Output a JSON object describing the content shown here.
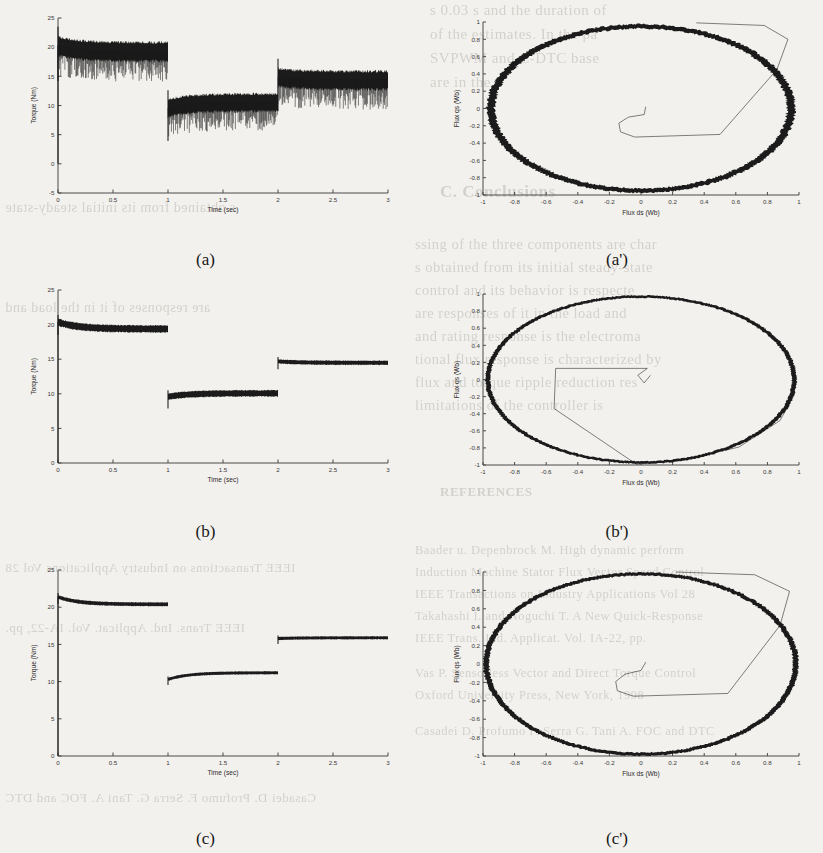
{
  "figure": {
    "panels": [
      {
        "id": "a",
        "caption": "(a)"
      },
      {
        "id": "a2",
        "caption": "(a')"
      },
      {
        "id": "b",
        "caption": "(b)"
      },
      {
        "id": "b2",
        "caption": "(b')"
      },
      {
        "id": "c",
        "caption": "(c)"
      },
      {
        "id": "c2",
        "caption": "(c')"
      }
    ]
  },
  "bleed_text": {
    "lines": [
      "s 0.03 s  and the duration of",
      "of the estimates.  In  the pa",
      "SVPWM and C-DTC base",
      "are in the",
      "C. Conclusions",
      "ssing of the three components are char",
      "s obtained  from  its initial  steady-state",
      "control  and  its behavior is  respecte",
      "are responses of  it  in  the  load  and",
      "and rating  response  is  the  electroma",
      "tional  flux  response  is  characterized  by",
      "flux  and  torque  ripple  reduction  res",
      "limitations of the controller is",
      "REFERENCES",
      "Baader  u.  Depenbrock  M.  High  dynamic perform",
      "Induction  Machine  Stator  Flux  Vector  Speed  Control",
      "IEEE  Transactions  on  Industry  Applications  Vol  28",
      "Takahashi  I.  and  Noguchi  T.  A  New  Quick-Response",
      "IEEE  Trans.  Ind.  Applicat.  Vol.  IA-22,  pp.",
      "Vas  P.  Sensorless  Vector  and  Direct  Torque  Control",
      "Oxford  University  Press,  New  York,  1998",
      "Casadei  D.  Profumo  F.  Serra  G.  Tani  A.  FOC  and  DTC"
    ]
  },
  "chart_data": [
    {
      "id": "a",
      "type": "line",
      "title": "",
      "xlabel": "Time (sec)",
      "ylabel": "Torque (Nm)",
      "xlim": [
        0,
        3
      ],
      "ylim": [
        -5,
        25
      ],
      "xticks": [
        0,
        0.5,
        1,
        1.5,
        2,
        2.5,
        3
      ],
      "xticklabels": [
        "0",
        "0.5",
        "1",
        "1.5",
        "2",
        "2.5",
        "3"
      ],
      "yticks": [
        -5,
        0,
        5,
        10,
        15,
        20,
        25
      ],
      "yticklabels": [
        "-5",
        "0",
        "5",
        "10",
        "15",
        "20",
        "25"
      ],
      "grid": false,
      "legend": "none",
      "description": "Electromagnetic torque with large hysteresis ripple; three load steps",
      "segments": [
        {
          "t_start": 0.0,
          "t_end": 1.0,
          "mean_start": 20.3,
          "mean_end": 19.3,
          "ripple": 3.2
        },
        {
          "t_start": 1.0,
          "t_end": 2.0,
          "mean_start": 9.6,
          "mean_end": 10.6,
          "ripple": 3.0
        },
        {
          "t_start": 2.0,
          "t_end": 3.0,
          "mean_start": 14.9,
          "mean_end": 14.4,
          "ripple": 3.1
        }
      ]
    },
    {
      "id": "a2",
      "type": "line",
      "title": "",
      "xlabel": "Flux ds (Wb)",
      "ylabel": "Flux qs (Wb)",
      "xlim": [
        -1,
        1
      ],
      "ylim": [
        -1,
        1
      ],
      "xticks": [
        -1,
        -0.8,
        -0.6,
        -0.4,
        -0.2,
        0,
        0.2,
        0.4,
        0.6,
        0.8,
        1
      ],
      "xticklabels": [
        "-1",
        "-0.8",
        "-0.6",
        "-0.4",
        "-0.2",
        "0",
        "0.2",
        "0.4",
        "0.6",
        "0.8",
        "1"
      ],
      "yticks": [
        -1,
        -0.8,
        -0.6,
        -0.4,
        -0.2,
        0,
        0.2,
        0.4,
        0.6,
        0.8,
        1
      ],
      "yticklabels": [
        "-1",
        "-0.8",
        "-0.6",
        "-0.4",
        "-0.2",
        "0",
        "0.2",
        "0.4",
        "0.6",
        "0.8",
        "1"
      ],
      "grid": false,
      "legend": "none",
      "description": "Stator flux locus: thick noisy circle radius ~0.95 Wb plus start-up polygon trajectory from origin",
      "circle_radius": 0.95,
      "circle_thickness": 0.05,
      "startup_path": [
        [
          0.03,
          0.02
        ],
        [
          0.02,
          -0.07
        ],
        [
          -0.08,
          -0.1
        ],
        [
          -0.14,
          -0.17
        ],
        [
          -0.13,
          -0.27
        ],
        [
          -0.04,
          -0.33
        ],
        [
          0.5,
          -0.3
        ],
        [
          0.86,
          0.45
        ],
        [
          0.93,
          0.8
        ],
        [
          0.78,
          0.96
        ],
        [
          0.35,
          0.99
        ]
      ]
    },
    {
      "id": "b",
      "type": "line",
      "title": "",
      "xlabel": "Time (sec)",
      "ylabel": "Torque (Nm)",
      "xlim": [
        0,
        3
      ],
      "ylim": [
        0,
        25
      ],
      "xticks": [
        0,
        0.5,
        1,
        1.5,
        2,
        2.5,
        3
      ],
      "xticklabels": [
        "0",
        "0.5",
        "1",
        "1.5",
        "2",
        "2.5",
        "3"
      ],
      "yticks": [
        0,
        5,
        10,
        15,
        20,
        25
      ],
      "yticklabels": [
        "0",
        "5",
        "10",
        "15",
        "20",
        "25"
      ],
      "grid": false,
      "legend": "none",
      "description": "Torque with reduced ripple; three load steps",
      "segments": [
        {
          "t_start": 0.0,
          "t_end": 1.0,
          "mean_start": 20.4,
          "mean_end": 19.4,
          "ripple": 1.0
        },
        {
          "t_start": 1.0,
          "t_end": 2.0,
          "mean_start": 9.6,
          "mean_end": 10.1,
          "ripple": 0.9
        },
        {
          "t_start": 2.0,
          "t_end": 3.0,
          "mean_start": 14.7,
          "mean_end": 14.5,
          "ripple": 0.6
        }
      ]
    },
    {
      "id": "b2",
      "type": "line",
      "title": "",
      "xlabel": "Flux ds (Wb)",
      "ylabel": "Flux qs (Wb)",
      "xlim": [
        -1,
        1
      ],
      "ylim": [
        -1,
        1
      ],
      "xticks": [
        -1,
        -0.8,
        -0.6,
        -0.4,
        -0.2,
        0,
        0.2,
        0.4,
        0.6,
        0.8,
        1
      ],
      "xticklabels": [
        "-1",
        "-0.8",
        "-0.6",
        "-0.4",
        "-0.2",
        "0",
        "0.2",
        "0.4",
        "0.6",
        "0.8",
        "1"
      ],
      "yticks": [
        -1,
        -0.8,
        -0.6,
        -0.4,
        -0.2,
        0,
        0.2,
        0.4,
        0.6,
        0.8,
        1
      ],
      "yticklabels": [
        "-1",
        "-0.8",
        "-0.6",
        "-0.4",
        "-0.2",
        "0",
        "0.2",
        "0.4",
        "0.6",
        "0.8",
        "1"
      ],
      "grid": false,
      "legend": "none",
      "description": "Stator flux locus: smoother circle radius ~0.97 Wb with start-up trajectory descending to -1 then sweeping right",
      "circle_radius": 0.97,
      "circle_thickness": 0.03,
      "startup_path": [
        [
          0.06,
          0.05
        ],
        [
          0.02,
          -0.04
        ],
        [
          -0.02,
          0.05
        ],
        [
          0.04,
          0.13
        ],
        [
          -0.54,
          0.13
        ],
        [
          -0.55,
          -0.34
        ],
        [
          -0.03,
          -0.99
        ],
        [
          0.25,
          -0.95
        ],
        [
          0.62,
          -0.79
        ],
        [
          0.88,
          -0.48
        ],
        [
          0.97,
          -0.18
        ],
        [
          0.96,
          -0.05
        ]
      ]
    },
    {
      "id": "c",
      "type": "line",
      "title": "",
      "xlabel": "Time (sec)",
      "ylabel": "Torque (Nm)",
      "xlim": [
        0,
        3
      ],
      "ylim": [
        0,
        25
      ],
      "xticks": [
        0,
        0.5,
        1,
        1.5,
        2,
        2.5,
        3
      ],
      "xticklabels": [
        "0",
        "0.5",
        "1",
        "1.5",
        "2",
        "2.5",
        "3"
      ],
      "yticks": [
        0,
        5,
        10,
        15,
        20,
        25
      ],
      "yticklabels": [
        "0",
        "5",
        "10",
        "15",
        "20",
        "25"
      ],
      "grid": false,
      "legend": "none",
      "description": "Torque with smallest ripple; three load steps with exponential settling",
      "segments": [
        {
          "t_start": 0.0,
          "t_end": 1.0,
          "mean_start": 21.4,
          "mean_end": 20.4,
          "ripple": 0.5
        },
        {
          "t_start": 1.0,
          "t_end": 2.0,
          "mean_start": 10.3,
          "mean_end": 11.2,
          "ripple": 0.4
        },
        {
          "t_start": 2.0,
          "t_end": 3.0,
          "mean_start": 15.8,
          "mean_end": 15.9,
          "ripple": 0.4
        }
      ]
    },
    {
      "id": "c2",
      "type": "line",
      "title": "",
      "xlabel": "Flux ds (Wb)",
      "ylabel": "Flux qs (Wb)",
      "xlim": [
        -1,
        1
      ],
      "ylim": [
        -1,
        1
      ],
      "xticks": [
        -1,
        -0.8,
        -0.6,
        -0.4,
        -0.2,
        0,
        0.2,
        0.4,
        0.6,
        0.8,
        1
      ],
      "xticklabels": [
        "-1",
        "-0.8",
        "-0.6",
        "-0.4",
        "-0.2",
        "0",
        "0.2",
        "0.4",
        "0.6",
        "0.8",
        "1"
      ],
      "yticks": [
        -1,
        -0.8,
        -0.6,
        -0.4,
        -0.2,
        0,
        0.2,
        0.4,
        0.6,
        0.8,
        1
      ],
      "yticklabels": [
        "-1",
        "-0.8",
        "-0.6",
        "-0.4",
        "-0.2",
        "0",
        "0.2",
        "0.4",
        "0.6",
        "0.8",
        "1"
      ],
      "grid": false,
      "legend": "none",
      "description": "Stator flux locus: clean thick circle radius ~0.98 Wb with start-up polygon from origin to upper right",
      "circle_radius": 0.98,
      "circle_thickness": 0.035,
      "startup_path": [
        [
          0.03,
          0.02
        ],
        [
          0.0,
          -0.07
        ],
        [
          -0.1,
          -0.11
        ],
        [
          -0.16,
          -0.19
        ],
        [
          -0.15,
          -0.29
        ],
        [
          -0.05,
          -0.35
        ],
        [
          0.55,
          -0.32
        ],
        [
          0.88,
          0.42
        ],
        [
          0.94,
          0.79
        ],
        [
          0.72,
          0.97
        ],
        [
          0.22,
          1.0
        ]
      ]
    }
  ]
}
